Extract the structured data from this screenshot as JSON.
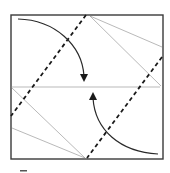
{
  "diagram": {
    "type": "origami-fold-instruction",
    "elements": {
      "paper": "square-sheet",
      "center_crease": "horizontal-crease",
      "valley_folds": [
        "valley-fold-left",
        "valley-fold-right"
      ],
      "reference_creases": [
        "crease-upper-right-a",
        "crease-upper-right-b",
        "crease-lower-left-a",
        "crease-lower-left-b"
      ],
      "fold_arrows": [
        {
          "name": "fold-arrow-top",
          "direction": "down"
        },
        {
          "name": "fold-arrow-bottom",
          "direction": "up"
        }
      ]
    },
    "colors": {
      "outline": "#3a3a3a",
      "crease": "#8a8a8a",
      "valley_fold": "#1a1a1a",
      "arrow": "#2a2a2a",
      "background": "#ffffff"
    },
    "step_marker": ""
  }
}
